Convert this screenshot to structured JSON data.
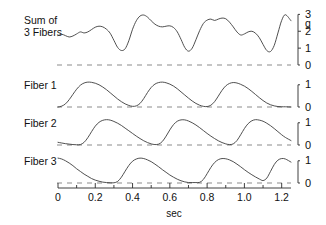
{
  "chart_data": {
    "type": "line",
    "title": "",
    "subtitle": "",
    "xlabel": "sec",
    "ylabel": "g",
    "grid": false,
    "legend": "none",
    "xlim": [
      0,
      1.25
    ],
    "x_ticks": [
      "0",
      "0.2",
      "0.4",
      "0.6",
      "0.8",
      "1.0",
      "1.2"
    ],
    "x_tick_values": [
      0,
      0.2,
      0.4,
      0.6,
      0.8,
      1.0,
      1.2
    ],
    "x_minor_tick_values": [
      0.1,
      0.3,
      0.5,
      0.7,
      0.9,
      1.1
    ],
    "panels": [
      {
        "name": "sum-of-3-fibers",
        "label": "Sum of\n3 Fibers",
        "unit": "g",
        "ylim": [
          0,
          3.2
        ],
        "y_ticks": [
          "0",
          "1",
          "2",
          "3"
        ],
        "y_tick_values": [
          0,
          1,
          2,
          3
        ],
        "baseline": 0,
        "series_name": "Sum of 3 Fibers",
        "x": [
          0.0,
          0.02,
          0.04,
          0.06,
          0.08,
          0.1,
          0.12,
          0.14,
          0.16,
          0.18,
          0.2,
          0.22,
          0.24,
          0.26,
          0.28,
          0.3,
          0.32,
          0.34,
          0.36,
          0.38,
          0.4,
          0.42,
          0.44,
          0.46,
          0.48,
          0.5,
          0.52,
          0.54,
          0.56,
          0.58,
          0.6,
          0.62,
          0.64,
          0.66,
          0.68,
          0.7,
          0.72,
          0.74,
          0.76,
          0.78,
          0.8,
          0.82,
          0.84,
          0.86,
          0.88,
          0.9,
          0.92,
          0.94,
          0.96,
          0.98,
          1.0,
          1.02,
          1.04,
          1.06,
          1.08,
          1.1,
          1.12,
          1.14,
          1.16,
          1.18,
          1.2,
          1.22,
          1.25
        ],
        "y": [
          1.74,
          1.82,
          1.74,
          1.66,
          1.72,
          1.84,
          1.96,
          1.9,
          1.96,
          2.1,
          2.24,
          2.3,
          2.26,
          2.12,
          1.88,
          1.46,
          1.04,
          0.86,
          0.96,
          1.44,
          2.12,
          2.62,
          2.9,
          2.96,
          2.84,
          2.62,
          2.42,
          2.3,
          2.26,
          2.3,
          2.32,
          2.22,
          1.96,
          1.52,
          1.04,
          0.82,
          1.0,
          1.5,
          2.04,
          2.46,
          2.66,
          2.72,
          2.64,
          2.72,
          2.78,
          2.74,
          2.54,
          2.26,
          1.96,
          1.78,
          1.84,
          1.96,
          2.0,
          1.88,
          1.62,
          1.22,
          0.86,
          0.8,
          1.16,
          1.9,
          2.64,
          2.98,
          2.62
        ]
      },
      {
        "name": "fiber-1",
        "label": "Fiber 1",
        "unit": "g",
        "ylim": [
          0,
          1.35
        ],
        "y_ticks": [
          "0",
          "1"
        ],
        "y_tick_values": [
          0,
          1
        ],
        "baseline": 0,
        "series_name": "Fiber 1",
        "x": [
          0.0,
          0.02,
          0.04,
          0.06,
          0.08,
          0.1,
          0.12,
          0.14,
          0.16,
          0.18,
          0.2,
          0.22,
          0.24,
          0.26,
          0.28,
          0.3,
          0.32,
          0.34,
          0.36,
          0.38,
          0.4,
          0.42,
          0.44,
          0.46,
          0.48,
          0.5,
          0.52,
          0.54,
          0.56,
          0.58,
          0.6,
          0.62,
          0.64,
          0.66,
          0.68,
          0.7,
          0.72,
          0.74,
          0.76,
          0.78,
          0.8,
          0.82,
          0.84,
          0.86,
          0.88,
          0.9,
          0.92,
          0.94,
          0.96,
          0.98,
          1.0,
          1.02,
          1.04,
          1.06,
          1.08,
          1.1,
          1.12,
          1.14,
          1.16,
          1.18,
          1.2,
          1.22,
          1.25
        ],
        "y": [
          0.0,
          0.04,
          0.14,
          0.33,
          0.57,
          0.8,
          0.98,
          1.08,
          1.12,
          1.11,
          1.07,
          1.0,
          0.9,
          0.78,
          0.64,
          0.5,
          0.36,
          0.24,
          0.14,
          0.07,
          0.03,
          0.05,
          0.16,
          0.38,
          0.65,
          0.88,
          1.03,
          1.1,
          1.12,
          1.09,
          1.03,
          0.94,
          0.82,
          0.68,
          0.54,
          0.4,
          0.27,
          0.16,
          0.08,
          0.03,
          0.02,
          0.08,
          0.24,
          0.49,
          0.75,
          0.95,
          1.06,
          1.1,
          1.08,
          1.02,
          0.94,
          0.83,
          0.7,
          0.56,
          0.42,
          0.29,
          0.18,
          0.1,
          0.05,
          0.02,
          0.01,
          0.01,
          0.0
        ]
      },
      {
        "name": "fiber-2",
        "label": "Fiber 2",
        "unit": "g",
        "ylim": [
          0,
          1.35
        ],
        "y_ticks": [
          "0",
          "1"
        ],
        "y_tick_values": [
          0,
          1
        ],
        "baseline": 0,
        "series_name": "Fiber 2",
        "x": [
          0.0,
          0.02,
          0.04,
          0.06,
          0.08,
          0.1,
          0.12,
          0.14,
          0.16,
          0.18,
          0.2,
          0.22,
          0.24,
          0.26,
          0.28,
          0.3,
          0.32,
          0.34,
          0.36,
          0.38,
          0.4,
          0.42,
          0.44,
          0.46,
          0.48,
          0.5,
          0.52,
          0.54,
          0.56,
          0.58,
          0.6,
          0.62,
          0.64,
          0.66,
          0.68,
          0.7,
          0.72,
          0.74,
          0.76,
          0.78,
          0.8,
          0.82,
          0.84,
          0.86,
          0.88,
          0.9,
          0.92,
          0.94,
          0.96,
          0.98,
          1.0,
          1.02,
          1.04,
          1.06,
          1.08,
          1.1,
          1.12,
          1.14,
          1.16,
          1.18,
          1.2,
          1.22,
          1.25
        ],
        "y": [
          0.12,
          0.09,
          0.06,
          0.04,
          0.02,
          0.01,
          0.02,
          0.12,
          0.33,
          0.6,
          0.85,
          1.02,
          1.11,
          1.14,
          1.12,
          1.06,
          0.98,
          0.88,
          0.76,
          0.64,
          0.52,
          0.4,
          0.29,
          0.19,
          0.11,
          0.05,
          0.02,
          0.04,
          0.16,
          0.4,
          0.68,
          0.92,
          1.07,
          1.13,
          1.13,
          1.08,
          1.0,
          0.9,
          0.78,
          0.65,
          0.52,
          0.4,
          0.29,
          0.19,
          0.11,
          0.05,
          0.02,
          0.05,
          0.2,
          0.46,
          0.74,
          0.96,
          1.09,
          1.14,
          1.12,
          1.07,
          0.98,
          0.87,
          0.74,
          0.6,
          0.46,
          0.34,
          0.2
        ]
      },
      {
        "name": "fiber-3",
        "label": "Fiber 3",
        "unit": "g",
        "ylim": [
          0,
          1.35
        ],
        "y_ticks": [
          "0",
          "1"
        ],
        "y_tick_values": [
          0,
          1
        ],
        "baseline": 0,
        "series_name": "Fiber 3",
        "x": [
          0.0,
          0.02,
          0.04,
          0.06,
          0.08,
          0.1,
          0.12,
          0.14,
          0.16,
          0.18,
          0.2,
          0.22,
          0.24,
          0.26,
          0.28,
          0.3,
          0.32,
          0.34,
          0.36,
          0.38,
          0.4,
          0.42,
          0.44,
          0.46,
          0.48,
          0.5,
          0.52,
          0.54,
          0.56,
          0.58,
          0.6,
          0.62,
          0.64,
          0.66,
          0.68,
          0.7,
          0.72,
          0.74,
          0.76,
          0.78,
          0.8,
          0.82,
          0.84,
          0.86,
          0.88,
          0.9,
          0.92,
          0.94,
          0.96,
          0.98,
          1.0,
          1.02,
          1.04,
          1.06,
          1.08,
          1.1,
          1.12,
          1.14,
          1.16,
          1.18,
          1.2,
          1.22,
          1.25
        ],
        "y": [
          1.12,
          1.08,
          1.0,
          0.9,
          0.78,
          0.64,
          0.52,
          0.4,
          0.3,
          0.2,
          0.13,
          0.08,
          0.04,
          0.02,
          0.01,
          0.01,
          0.07,
          0.26,
          0.53,
          0.79,
          0.98,
          1.08,
          1.12,
          1.1,
          1.04,
          0.96,
          0.85,
          0.73,
          0.6,
          0.48,
          0.36,
          0.26,
          0.17,
          0.1,
          0.05,
          0.02,
          0.02,
          0.02,
          0.03,
          0.16,
          0.42,
          0.7,
          0.92,
          1.05,
          1.1,
          1.09,
          1.04,
          0.96,
          0.85,
          0.73,
          0.6,
          0.48,
          0.37,
          0.27,
          0.18,
          0.11,
          0.22,
          0.52,
          0.83,
          1.03,
          1.1,
          1.08,
          0.94
        ]
      }
    ]
  },
  "style": {
    "trace_color": "#3c3c3c",
    "axis_color": "#2b2b2b",
    "baseline_color": "#8c8c8c",
    "background": "#ffffff"
  }
}
